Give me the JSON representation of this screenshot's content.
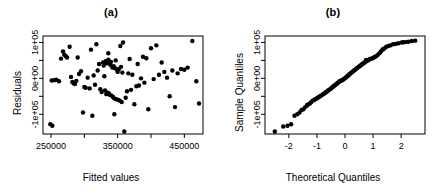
{
  "figure": {
    "width": 444,
    "height": 195,
    "background": "#ffffff",
    "foreground": "#000000",
    "point_color": "#000000"
  },
  "panels": [
    {
      "id": "a",
      "title": "(a)",
      "xlabel": "Fitted values",
      "ylabel": "Residuals"
    },
    {
      "id": "b",
      "title": "(b)",
      "xlabel": "Theoretical Quantiles",
      "ylabel": "Sample Quantiles"
    }
  ],
  "chart_data": [
    {
      "type": "scatter",
      "panel": "a",
      "title": "(a)",
      "xlabel": "Fitted values",
      "ylabel": "Residuals",
      "xlim": [
        238000,
        478000
      ],
      "ylim": [
        -155000,
        118000
      ],
      "xticks": [
        250000,
        300000,
        350000,
        400000,
        450000
      ],
      "xticklabels": [
        "250000",
        "",
        "350000",
        "",
        "450000"
      ],
      "yticks": [
        -100000,
        -50000,
        0,
        50000,
        100000
      ],
      "yticklabels": [
        "-1e+05",
        "",
        "0e+00",
        "",
        "1e+05"
      ],
      "grid": false,
      "legend": null,
      "x": [
        249000,
        251000,
        252000,
        255000,
        258000,
        262000,
        265000,
        268000,
        270000,
        272000,
        274000,
        278000,
        280000,
        282000,
        284000,
        286000,
        288000,
        290000,
        292000,
        295000,
        298000,
        300000,
        302000,
        305000,
        308000,
        310000,
        312000,
        314000,
        316000,
        318000,
        320000,
        322000,
        324000,
        326000,
        328000,
        329000,
        330000,
        331000,
        332000,
        333000,
        334000,
        335000,
        336000,
        337000,
        338000,
        339000,
        340000,
        341000,
        342000,
        343000,
        344000,
        345000,
        346000,
        347000,
        348000,
        349000,
        350000,
        351000,
        352000,
        353000,
        354000,
        355000,
        356000,
        357000,
        358000,
        360000,
        362000,
        364000,
        366000,
        368000,
        370000,
        372000,
        375000,
        378000,
        380000,
        382000,
        385000,
        388000,
        390000,
        393000,
        396000,
        400000,
        404000,
        408000,
        412000,
        416000,
        420000,
        424000,
        428000,
        432000,
        436000,
        440000,
        445000,
        450000,
        455000,
        462000,
        468000,
        472000,
        336000,
        345000
      ],
      "y": [
        -128000,
        -6000,
        -132000,
        -5000,
        -4000,
        -8000,
        55000,
        75000,
        66000,
        62000,
        58000,
        88000,
        4000,
        -10000,
        -14000,
        -16000,
        -7000,
        58000,
        12000,
        20000,
        -95000,
        -24000,
        -26000,
        2000,
        -28000,
        80000,
        -104000,
        8000,
        -18000,
        95000,
        22000,
        40000,
        -30000,
        -38000,
        44000,
        36000,
        6000,
        -34000,
        48000,
        -44000,
        42000,
        -40000,
        52000,
        -42000,
        -46000,
        38000,
        46000,
        -48000,
        30000,
        -52000,
        34000,
        -56000,
        28000,
        50000,
        -58000,
        24000,
        18000,
        -60000,
        26000,
        -62000,
        90000,
        32000,
        -66000,
        16000,
        100000,
        -148000,
        -54000,
        -36000,
        14000,
        54000,
        -32000,
        10000,
        -72000,
        -22000,
        40000,
        -20000,
        0,
        60000,
        -12000,
        56000,
        -86000,
        84000,
        -2000,
        92000,
        10000,
        44000,
        18000,
        2000,
        -50000,
        22000,
        -80000,
        14000,
        26000,
        24000,
        30000,
        104000,
        -8000,
        -70000,
        70000,
        -100000
      ],
      "n_points": 100
    },
    {
      "type": "scatter",
      "panel": "b",
      "title": "(b)",
      "xlabel": "Theoretical Quantiles",
      "ylabel": "Sample Quantiles",
      "xlim": [
        -2.85,
        2.85
      ],
      "ylim": [
        -155000,
        118000
      ],
      "xticks": [
        -2,
        -1,
        0,
        1,
        2
      ],
      "xticklabels": [
        "-2",
        "-1",
        "0",
        "1",
        "2"
      ],
      "yticks": [
        -100000,
        -50000,
        0,
        50000,
        100000
      ],
      "yticklabels": [
        "-1e+05",
        "",
        "0e+00",
        "",
        "1e+05"
      ],
      "grid": false,
      "legend": null,
      "note": "Normal Q-Q plot: monotone increasing point cloud, isolated low outlier at lower-left and isolated high point at upper-right",
      "x": [
        -2.5,
        -2.05,
        -1.92,
        -1.8,
        -1.7,
        -1.62,
        -1.55,
        -1.48,
        -1.42,
        -1.36,
        -1.3,
        -1.25,
        -1.2,
        -1.15,
        -1.1,
        -1.06,
        -1.01,
        -0.97,
        -0.93,
        -0.89,
        -0.85,
        -0.81,
        -0.78,
        -0.74,
        -0.7,
        -0.67,
        -0.63,
        -0.6,
        -0.57,
        -0.53,
        -0.5,
        -0.47,
        -0.44,
        -0.41,
        -0.37,
        -0.34,
        -0.31,
        -0.28,
        -0.25,
        -0.22,
        -0.19,
        -0.16,
        -0.13,
        -0.1,
        -0.07,
        -0.04,
        -0.01,
        0.02,
        0.05,
        0.08,
        0.11,
        0.14,
        0.17,
        0.2,
        0.23,
        0.26,
        0.29,
        0.32,
        0.36,
        0.39,
        0.42,
        0.45,
        0.49,
        0.52,
        0.55,
        0.59,
        0.62,
        0.66,
        0.7,
        0.73,
        0.77,
        0.81,
        0.85,
        0.89,
        0.94,
        0.98,
        1.03,
        1.07,
        1.12,
        1.17,
        1.23,
        1.28,
        1.34,
        1.41,
        1.47,
        1.55,
        1.62,
        1.71,
        1.8,
        1.9,
        2.02,
        2.08,
        2.16,
        2.26,
        2.38,
        2.5,
        -2.2,
        -1.35,
        1.35,
        0.75
      ],
      "y": [
        -148000,
        -132000,
        -128000,
        -104000,
        -100000,
        -95000,
        -88000,
        -86000,
        -80000,
        -76000,
        -72000,
        -70000,
        -66000,
        -62000,
        -60000,
        -58000,
        -56000,
        -54000,
        -52000,
        -50000,
        -48000,
        -46000,
        -44000,
        -42000,
        -40000,
        -38000,
        -36000,
        -34000,
        -32000,
        -30000,
        -28000,
        -26000,
        -24000,
        -22000,
        -20000,
        -18000,
        -16000,
        -14000,
        -12000,
        -10000,
        -8000,
        -7000,
        -6000,
        -5000,
        -4000,
        -2000,
        0,
        2000,
        4000,
        6000,
        8000,
        10000,
        12000,
        14000,
        16000,
        18000,
        20000,
        22000,
        24000,
        26000,
        28000,
        30000,
        32000,
        34000,
        36000,
        38000,
        40000,
        42000,
        44000,
        46000,
        48000,
        50000,
        52000,
        54000,
        55000,
        56000,
        58000,
        60000,
        62000,
        66000,
        70000,
        75000,
        80000,
        84000,
        88000,
        90000,
        92000,
        95000,
        96000,
        98000,
        100000,
        100500,
        101000,
        102000,
        104000,
        105000,
        -134000,
        -74000,
        81000,
        51000
      ],
      "n_points": 100
    }
  ]
}
